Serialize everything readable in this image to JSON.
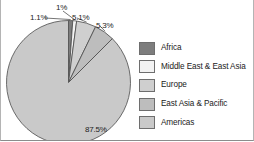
{
  "chart_data": {
    "type": "pie",
    "title": "",
    "subtitle": "",
    "xlabel": "",
    "ylabel": "",
    "grid": false,
    "legend_position": "right",
    "start_angle_deg": 0,
    "direction": "clockwise",
    "categories": [
      "Africa",
      "Middle East & East Asia",
      "Europe",
      "East Asia & Pacific",
      "Americas"
    ],
    "values": [
      1.1,
      1.0,
      5.1,
      5.3,
      87.5
    ],
    "value_labels": [
      "1.1%",
      "1%",
      "5.1%",
      "5.3%",
      "87.5%"
    ],
    "colors": [
      "#7d7d7d",
      "#f2f2f2",
      "#cfcfcf",
      "#bdbdbd",
      "#c9c9c9"
    ],
    "slices": [
      {
        "label": "Africa",
        "value": 1.1,
        "value_label": "1.1%",
        "color": "#7d7d7d"
      },
      {
        "label": "Middle East & East Asia",
        "value": 1.0,
        "value_label": "1%",
        "color": "#f2f2f2"
      },
      {
        "label": "Europe",
        "value": 5.1,
        "value_label": "5.1%",
        "color": "#cfcfcf"
      },
      {
        "label": "East Asia & Pacific",
        "value": 5.3,
        "value_label": "5.3%",
        "color": "#bdbdbd"
      },
      {
        "label": "Americas",
        "value": 87.5,
        "value_label": "87.5%",
        "color": "#c9c9c9"
      }
    ]
  },
  "legend": {
    "items": [
      {
        "label": "Africa",
        "color": "#7d7d7d"
      },
      {
        "label": "Middle East & East Asia",
        "color": "#f2f2f2"
      },
      {
        "label": "Europe",
        "color": "#cfcfcf"
      },
      {
        "label": "East Asia & Pacific",
        "color": "#bdbdbd"
      },
      {
        "label": "Americas",
        "color": "#c9c9c9"
      }
    ]
  }
}
